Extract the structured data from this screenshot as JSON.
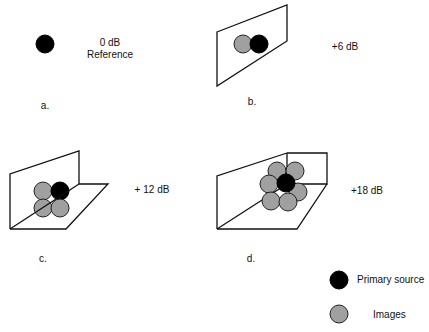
{
  "colors": {
    "primary_source": "#000000",
    "image": "#a0a0a0",
    "stroke": "#111111",
    "background": "#ffffff"
  },
  "panels": [
    {
      "id": "a",
      "label": "a.",
      "gain": "0 dB",
      "note": "Reference",
      "boundaries": 0,
      "image_count": 0
    },
    {
      "id": "b",
      "label": "b.",
      "gain": "+6 dB",
      "boundaries": 1,
      "image_count": 1
    },
    {
      "id": "c",
      "label": "c.",
      "gain": "+ 12 dB",
      "boundaries": 2,
      "image_count": 3
    },
    {
      "id": "d",
      "label": "d.",
      "gain": "+18 dB",
      "boundaries": 3,
      "image_count": 7
    }
  ],
  "legend": {
    "items": [
      {
        "label": "Primary source",
        "icon": "black-circle"
      },
      {
        "label": "Images",
        "icon": "gray-circle"
      }
    ]
  }
}
